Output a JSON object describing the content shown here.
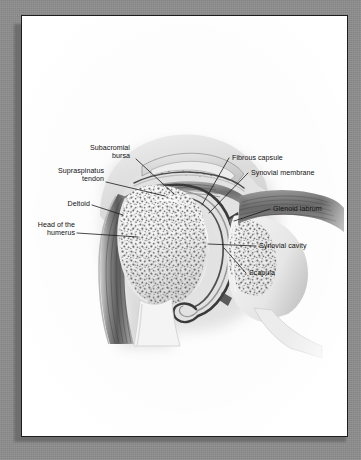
{
  "figure": {
    "style": "grayscale halftone medical illustration on a white textbook page",
    "page_background_color": "#fdfdfd",
    "desk_background_color": "#8d8d8d",
    "border_color": "#1d1d1d",
    "label_text_color": "#111111",
    "leader_line_color": "#1a1a1a"
  },
  "labels": {
    "subacromial_bursa": "Subacromial\nbursa",
    "supraspinatus_tendon": "Supraspinatus\ntendon",
    "deltoid": "Deltoid",
    "head_of_the_humerus": "Head of the\nhumerus",
    "fibrous_capsule": "Fibrous capsule",
    "synovial_membrane": "Synovial membrane",
    "glenoid_labrum": "Glenoid labrum",
    "synovial_cavity": "Synovial cavity",
    "scapula": "Scapula"
  },
  "structures": [
    {
      "name": "acromion",
      "side": "superior"
    },
    {
      "name": "subacromial bursa",
      "side": "superior"
    },
    {
      "name": "supraspinatus tendon",
      "side": "superior"
    },
    {
      "name": "deltoid muscle",
      "side": "left"
    },
    {
      "name": "head of the humerus",
      "side": "left-center"
    },
    {
      "name": "humeral shaft",
      "side": "inferior-left"
    },
    {
      "name": "fibrous capsule",
      "side": "center"
    },
    {
      "name": "synovial membrane",
      "side": "center"
    },
    {
      "name": "synovial cavity",
      "side": "center"
    },
    {
      "name": "glenoid labrum",
      "side": "right"
    },
    {
      "name": "glenoid fossa",
      "side": "right"
    },
    {
      "name": "scapula",
      "side": "right"
    },
    {
      "name": "inferior recess",
      "side": "inferior-center"
    }
  ]
}
